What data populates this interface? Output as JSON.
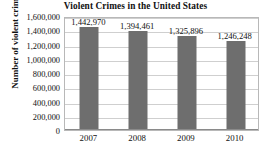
{
  "chart_data": {
    "type": "bar",
    "title": "Violent Crimes in the United States",
    "xlabel": "",
    "ylabel": "Number of violent crimes",
    "categories": [
      "2007",
      "2008",
      "2009",
      "2010"
    ],
    "values": [
      1442970,
      1394461,
      1325896,
      1246248
    ],
    "data_labels": [
      "1,442,970",
      "1,394,461",
      "1,325,896",
      "1,246,248"
    ],
    "ylim": [
      0,
      1600000
    ],
    "ytick_values": [
      0,
      200000,
      400000,
      600000,
      800000,
      1000000,
      1200000,
      1400000,
      1600000
    ],
    "ytick_labels": [
      "0",
      "200,000",
      "400,000",
      "600,000",
      "800,000",
      "1,000,000",
      "1,200,000",
      "1,400,000",
      "1,600,000"
    ],
    "grid": true,
    "legend": false,
    "bar_color": "#6e6e6e",
    "gridline_color": "#cfcfcf",
    "plot_border_color": "#b8b8b8",
    "text_color": "#111111",
    "background_color": "#ffffff"
  }
}
